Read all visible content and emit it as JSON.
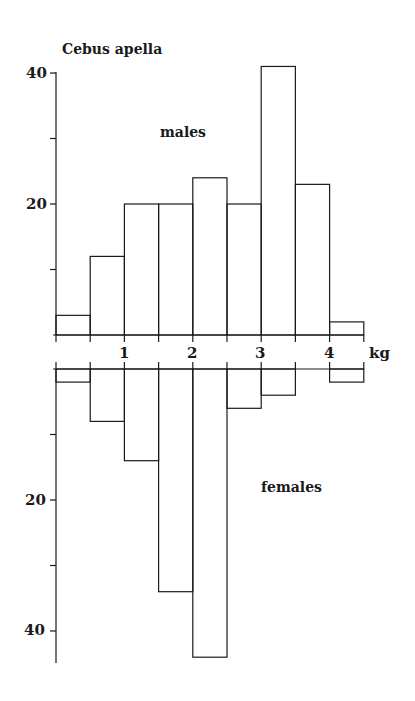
{
  "chart_data": {
    "type": "bar",
    "title": "Cebus apella",
    "xlabel": "kg",
    "ylabel": "",
    "x_tick_labels": [
      "1",
      "2",
      "3",
      "4"
    ],
    "x_ticks": [
      1,
      2,
      3,
      4
    ],
    "bin_width": 0.5,
    "bin_edges": [
      0,
      0.5,
      1,
      1.5,
      2,
      2.5,
      3,
      3.5,
      4,
      4.5
    ],
    "categories": [
      "0-0.5",
      "0.5-1",
      "1-1.5",
      "1.5-2",
      "2-2.5",
      "2.5-3",
      "3-3.5",
      "3.5-4",
      "4-4.5"
    ],
    "series": [
      {
        "name": "males",
        "values": [
          3,
          12,
          20,
          20,
          24,
          20,
          41,
          23,
          2
        ],
        "direction": "up",
        "y_tick_labels": [
          "20",
          "40"
        ],
        "ylim": [
          0,
          45
        ]
      },
      {
        "name": "females",
        "values": [
          2,
          8,
          14,
          34,
          44,
          6,
          4,
          0,
          2
        ],
        "direction": "down",
        "y_tick_labels": [
          "20",
          "40"
        ],
        "ylim": [
          0,
          45
        ]
      }
    ],
    "grid": false,
    "legend": "none (inline panel labels)"
  },
  "labels": {
    "title": "Cebus apella",
    "males": "males",
    "females": "females",
    "unit": "kg",
    "y_top_40": "40",
    "y_top_20": "20",
    "y_bot_20": "20",
    "y_bot_40": "40",
    "x1": "1",
    "x2": "2",
    "x3": "3",
    "x4": "4"
  },
  "colors": {
    "stroke": "#1a1a1a",
    "background": "#ffffff"
  }
}
